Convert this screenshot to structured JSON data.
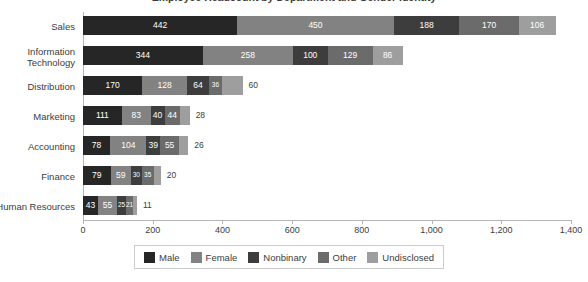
{
  "chart_data": {
    "type": "bar",
    "orientation": "horizontal",
    "stacked": true,
    "title": "Employee Headcount by Department and Gender Identity",
    "xlabel": "",
    "ylabel": "",
    "xlim": [
      0,
      1400
    ],
    "xticks": [
      0,
      200,
      400,
      600,
      800,
      1000,
      1200,
      1400
    ],
    "xtick_labels": [
      "0",
      "200",
      "400",
      "600",
      "800",
      "1,000",
      "1,200",
      "1,400"
    ],
    "grid": false,
    "legend_position": "bottom",
    "categories": [
      "Sales",
      "Information\nTechnology",
      "Distribution",
      "Marketing",
      "Accounting",
      "Finance",
      "Human Resources"
    ],
    "series": [
      {
        "name": "Male",
        "color": "#262626",
        "values": [
          442,
          344,
          170,
          111,
          78,
          79,
          43
        ]
      },
      {
        "name": "Female",
        "color": "#828282",
        "values": [
          450,
          258,
          128,
          83,
          104,
          59,
          55
        ]
      },
      {
        "name": "Nonbinary",
        "color": "#3d3d3d",
        "values": [
          188,
          100,
          64,
          40,
          39,
          30,
          25
        ]
      },
      {
        "name": "Other",
        "color": "#6b6b6b",
        "values": [
          170,
          129,
          36,
          44,
          55,
          35,
          21
        ]
      },
      {
        "name": "Undisclosed",
        "color": "#9e9e9e",
        "values": [
          106,
          86,
          60,
          28,
          26,
          20,
          11
        ]
      }
    ],
    "totals": [
      1356,
      917,
      458,
      306,
      302,
      223,
      155
    ]
  },
  "legend": {
    "items": [
      {
        "label": "Male",
        "color": "#262626"
      },
      {
        "label": "Female",
        "color": "#828282"
      },
      {
        "label": "Nonbinary",
        "color": "#3d3d3d"
      },
      {
        "label": "Other",
        "color": "#6b6b6b"
      },
      {
        "label": "Undisclosed",
        "color": "#9e9e9e"
      }
    ]
  }
}
